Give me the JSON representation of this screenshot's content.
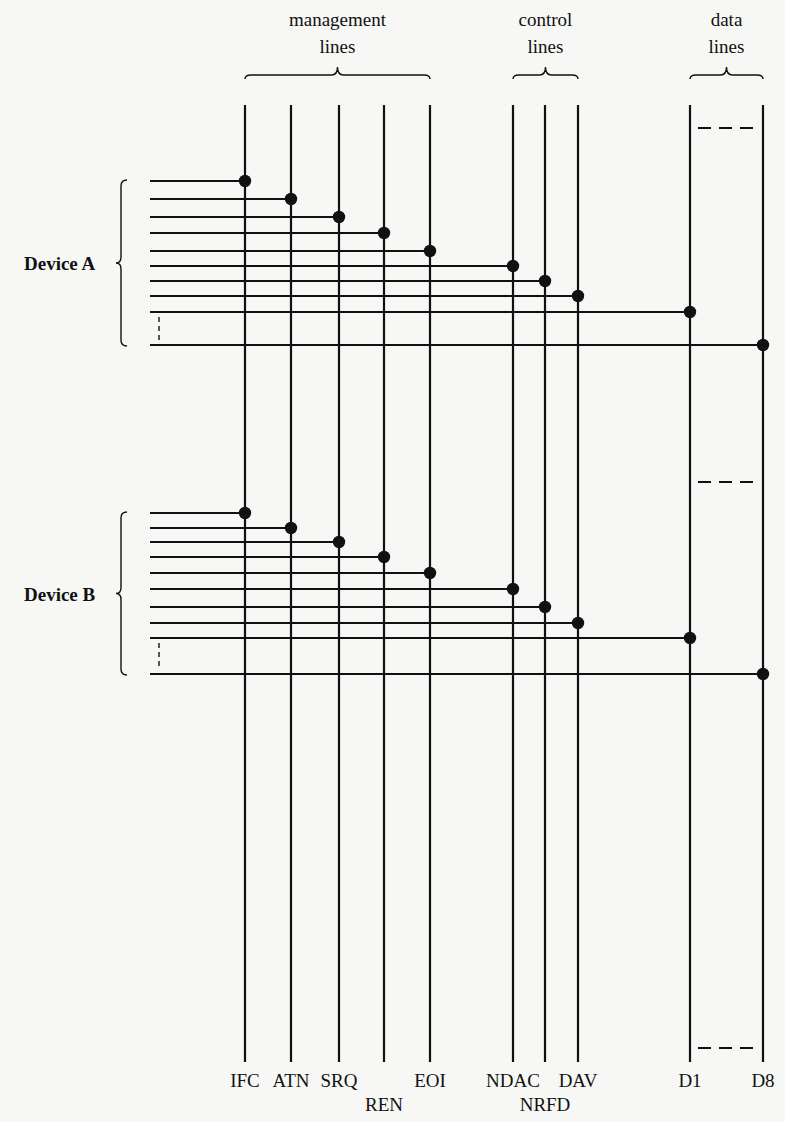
{
  "groups": [
    {
      "id": "management",
      "line1": "management",
      "line2": "lines",
      "x1": 245,
      "x2": 430
    },
    {
      "id": "control",
      "line1": "control",
      "line2": "lines",
      "x1": 513,
      "x2": 578
    },
    {
      "id": "data",
      "line1": "data",
      "line2": "lines",
      "x1": 690,
      "x2": 763
    }
  ],
  "bus_lines": [
    {
      "name": "IFC",
      "x": 245,
      "label_row": 0
    },
    {
      "name": "ATN",
      "x": 291,
      "label_row": 0
    },
    {
      "name": "SRQ",
      "x": 339,
      "label_row": 0
    },
    {
      "name": "REN",
      "x": 384,
      "label_row": 1
    },
    {
      "name": "EOI",
      "x": 430,
      "label_row": 0
    },
    {
      "name": "NDAC",
      "x": 513,
      "label_row": 0
    },
    {
      "name": "NRFD",
      "x": 545,
      "label_row": 1
    },
    {
      "name": "DAV",
      "x": 578,
      "label_row": 0
    },
    {
      "name": "D1",
      "x": 690,
      "label_row": 0
    },
    {
      "name": "D8",
      "x": 763,
      "label_row": 0
    }
  ],
  "devices": [
    {
      "label": "Device A",
      "connections_y": [
        181,
        199,
        217,
        233,
        251,
        266,
        281,
        296,
        312,
        345
      ],
      "brace_top": 180,
      "brace_bottom": 346
    },
    {
      "label": "Device B",
      "connections_y": [
        513,
        528,
        542,
        557,
        573,
        589,
        607,
        623,
        638,
        674
      ],
      "brace_top": 512,
      "brace_bottom": 675
    }
  ],
  "colors": {
    "ink": "#111111",
    "paper": "#f7f7f5"
  }
}
